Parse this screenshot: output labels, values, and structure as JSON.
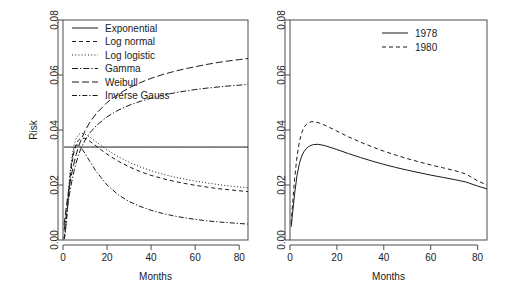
{
  "figure": {
    "title": "",
    "panels": 2
  },
  "chart_data": [
    {
      "type": "line",
      "panel": "left",
      "title": "",
      "xlabel": "Months",
      "ylabel": "Risk",
      "xlim": [
        0,
        84
      ],
      "ylim": [
        0,
        0.08
      ],
      "xticks": [
        0,
        20,
        40,
        60,
        80
      ],
      "xticklabels": [
        "0",
        "20",
        "40",
        "60",
        "80"
      ],
      "yticks": [
        0.0,
        0.02,
        0.04,
        0.06,
        0.08
      ],
      "yticklabels": [
        "0.00",
        "0.02",
        "0.04",
        "0.06",
        "0.08"
      ],
      "grid": false,
      "legend_position": "top-left",
      "x": [
        0.5,
        1,
        2,
        3,
        4,
        5,
        6,
        7,
        8,
        10,
        12,
        15,
        20,
        25,
        30,
        35,
        40,
        45,
        50,
        55,
        60,
        65,
        70,
        75,
        80,
        84
      ],
      "series": [
        {
          "name": "Exponential",
          "dash": "solid",
          "values": [
            0.0338,
            0.0338,
            0.0338,
            0.0338,
            0.0338,
            0.0338,
            0.0338,
            0.0338,
            0.0338,
            0.0338,
            0.0338,
            0.0338,
            0.0338,
            0.0338,
            0.0338,
            0.0338,
            0.0338,
            0.0338,
            0.0338,
            0.0338,
            0.0338,
            0.0338,
            0.0338,
            0.0338,
            0.0338,
            0.0338
          ]
        },
        {
          "name": "Log normal",
          "dash": "dashed",
          "values": [
            0.0005,
            0.003,
            0.0115,
            0.0205,
            0.0275,
            0.032,
            0.0348,
            0.0363,
            0.037,
            0.037,
            0.036,
            0.0342,
            0.0312,
            0.0287,
            0.0266,
            0.0249,
            0.0235,
            0.0224,
            0.0214,
            0.0206,
            0.0199,
            0.0193,
            0.0187,
            0.0183,
            0.0179,
            0.0176
          ]
        },
        {
          "name": "Log logistic",
          "dash": "dotted",
          "values": [
            0.0008,
            0.004,
            0.0135,
            0.023,
            0.03,
            0.0344,
            0.037,
            0.0383,
            0.0388,
            0.0385,
            0.0375,
            0.0357,
            0.0328,
            0.0303,
            0.0283,
            0.0266,
            0.0252,
            0.024,
            0.023,
            0.0222,
            0.0214,
            0.0208,
            0.0202,
            0.0197,
            0.0193,
            0.019
          ]
        },
        {
          "name": "Gamma",
          "dash": "dashdot-long",
          "values": [
            0.0035,
            0.0065,
            0.012,
            0.017,
            0.0213,
            0.025,
            0.0282,
            0.0308,
            0.033,
            0.0363,
            0.0388,
            0.0415,
            0.0448,
            0.0472,
            0.049,
            0.0504,
            0.0516,
            0.0526,
            0.0534,
            0.0541,
            0.0547,
            0.0552,
            0.0556,
            0.056,
            0.0563,
            0.0566
          ]
        },
        {
          "name": "Weibull",
          "dash": "longdash",
          "values": [
            0.0055,
            0.009,
            0.015,
            0.02,
            0.0243,
            0.028,
            0.0312,
            0.0338,
            0.036,
            0.0397,
            0.0426,
            0.0459,
            0.05,
            0.053,
            0.0553,
            0.0572,
            0.0588,
            0.0601,
            0.0612,
            0.0622,
            0.063,
            0.0638,
            0.0645,
            0.0651,
            0.0656,
            0.066
          ]
        },
        {
          "name": "Inverse Gauss",
          "dash": "dashdot",
          "values": [
            0.0002,
            0.002,
            0.011,
            0.0215,
            0.029,
            0.033,
            0.0345,
            0.0345,
            0.0338,
            0.0315,
            0.0288,
            0.025,
            0.02,
            0.0165,
            0.014,
            0.0122,
            0.0108,
            0.0097,
            0.0088,
            0.0081,
            0.0075,
            0.007,
            0.0066,
            0.0063,
            0.006,
            0.0058
          ]
        }
      ]
    },
    {
      "type": "line",
      "panel": "right",
      "title": "",
      "xlabel": "Months",
      "ylabel": "",
      "xlim": [
        0,
        84
      ],
      "ylim": [
        0,
        0.08
      ],
      "xticks": [
        0,
        20,
        40,
        60,
        80
      ],
      "xticklabels": [
        "0",
        "20",
        "40",
        "60",
        "80"
      ],
      "yticks": [
        0.0,
        0.02,
        0.04,
        0.06,
        0.08
      ],
      "yticklabels": [
        "0.00",
        "0.02",
        "0.04",
        "0.06",
        "0.08"
      ],
      "grid": false,
      "legend_position": "top-right",
      "x": [
        0.5,
        1,
        2,
        3,
        4,
        5,
        6,
        7,
        8,
        9,
        10,
        12,
        15,
        20,
        25,
        30,
        35,
        40,
        45,
        50,
        55,
        60,
        65,
        70,
        75,
        80,
        84
      ],
      "series": [
        {
          "name": "1978",
          "dash": "solid",
          "values": [
            0.0048,
            0.009,
            0.017,
            0.0235,
            0.0278,
            0.0305,
            0.0322,
            0.0333,
            0.034,
            0.0344,
            0.0347,
            0.0348,
            0.0343,
            0.0329,
            0.0314,
            0.03,
            0.0287,
            0.0275,
            0.0264,
            0.0254,
            0.0245,
            0.0236,
            0.0228,
            0.022,
            0.0211,
            0.0196,
            0.0186
          ]
        },
        {
          "name": "1980",
          "dash": "dashed",
          "values": [
            0.006,
            0.012,
            0.0225,
            0.0305,
            0.0357,
            0.039,
            0.041,
            0.0421,
            0.0427,
            0.043,
            0.043,
            0.0427,
            0.0417,
            0.0396,
            0.0375,
            0.0356,
            0.0339,
            0.0323,
            0.0309,
            0.0296,
            0.0284,
            0.0273,
            0.0263,
            0.0253,
            0.024,
            0.0215,
            0.02
          ]
        }
      ]
    }
  ]
}
